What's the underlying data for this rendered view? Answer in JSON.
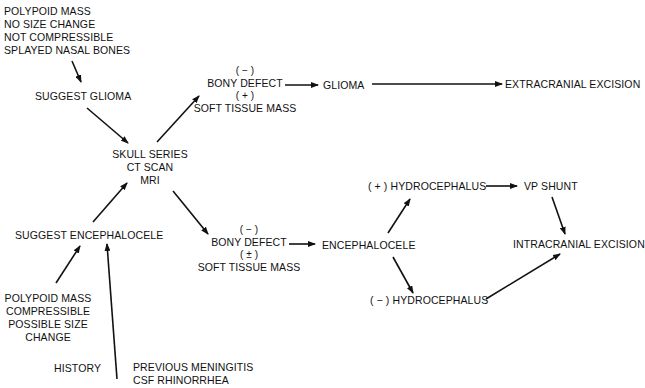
{
  "nodes": {
    "glioma_findings": [
      "POLYPOID MASS",
      "NO SIZE CHANGE",
      "NOT COMPRESSIBLE",
      "SPLAYED NASAL BONES"
    ],
    "suggest_glioma": "SUGGEST GLIOMA",
    "imaging": [
      "SKULL SERIES",
      "CT SCAN",
      "MRI"
    ],
    "suggest_encephalocele": "SUGGEST ENCEPHALOCELE",
    "encephalocele_findings": [
      "POLYPOID MASS",
      "COMPRESSIBLE",
      "POSSIBLE SIZE",
      "CHANGE"
    ],
    "history_label": "HISTORY",
    "history_items": [
      "PREVIOUS MENINGITIS",
      "CSF RHINORRHEA"
    ],
    "glioma_imaging": {
      "bony_sign": "( − )",
      "bony": "BONY DEFECT",
      "soft_sign": "( + )",
      "soft": "SOFT TISSUE MASS"
    },
    "glioma": "GLIOMA",
    "extracranial_excision": "EXTRACRANIAL EXCISION",
    "encephalocele_imaging": {
      "bony_sign": "( − )",
      "bony": "BONY DEFECT",
      "soft_sign": "( ± )",
      "soft": "SOFT TISSUE MASS"
    },
    "encephalocele": "ENCEPHALOCELE",
    "pos_hydrocephalus": "( + ) HYDROCEPHALUS",
    "neg_hydrocephalus": "( − ) HYDROCEPHALUS",
    "vp_shunt": "VP SHUNT",
    "intracranial_excision": "INTRACRANIAL EXCISION"
  },
  "edges": [
    {
      "from": "glioma_findings",
      "to": "suggest_glioma"
    },
    {
      "from": "suggest_glioma",
      "to": "imaging"
    },
    {
      "from": "suggest_encephalocele",
      "to": "imaging"
    },
    {
      "from": "encephalocele_findings",
      "to": "suggest_encephalocele"
    },
    {
      "from": "history",
      "to": "suggest_encephalocele"
    },
    {
      "from": "imaging",
      "to": "glioma_imaging"
    },
    {
      "from": "imaging",
      "to": "encephalocele_imaging"
    },
    {
      "from": "glioma_imaging",
      "to": "glioma"
    },
    {
      "from": "glioma",
      "to": "extracranial_excision"
    },
    {
      "from": "encephalocele_imaging",
      "to": "encephalocele"
    },
    {
      "from": "encephalocele",
      "to": "pos_hydrocephalus"
    },
    {
      "from": "encephalocele",
      "to": "neg_hydrocephalus"
    },
    {
      "from": "pos_hydrocephalus",
      "to": "vp_shunt"
    },
    {
      "from": "vp_shunt",
      "to": "intracranial_excision"
    },
    {
      "from": "neg_hydrocephalus",
      "to": "intracranial_excision"
    }
  ]
}
